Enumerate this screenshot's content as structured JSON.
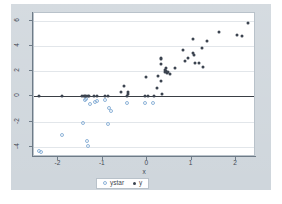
{
  "chart_data": {
    "type": "scatter",
    "title": "",
    "xlabel": "x",
    "ylabel": "",
    "xlim": [
      -2.55,
      2.45
    ],
    "ylim": [
      -4.8,
      6.6
    ],
    "xticks": [
      -2,
      -1,
      0,
      1,
      2
    ],
    "xticklabels": [
      "-2",
      "-1",
      "0",
      "1",
      "2"
    ],
    "yticks": [
      -4,
      -2,
      0,
      2,
      4,
      6
    ],
    "yticklabels": [
      "-4",
      "-2",
      "0",
      "2",
      "4",
      "6"
    ],
    "grid": "horizontal",
    "zero_line": true,
    "legend_position": "below-center",
    "series": [
      {
        "name": "ystar",
        "marker": "open-circle",
        "color": "#8fb4d9",
        "points": [
          [
            -2.44,
            -4.3
          ],
          [
            -2.4,
            -4.38
          ],
          [
            -1.92,
            -3.05
          ],
          [
            -1.44,
            -2.12
          ],
          [
            -1.36,
            -3.55
          ],
          [
            -1.33,
            -3.95
          ],
          [
            -1.3,
            -0.62
          ],
          [
            -1.18,
            -0.42
          ],
          [
            -1.12,
            -0.38
          ],
          [
            -0.96,
            -0.3
          ],
          [
            -0.88,
            -2.22
          ],
          [
            -0.86,
            -0.95
          ],
          [
            -0.82,
            -1.15
          ],
          [
            -0.46,
            -0.55
          ],
          [
            -0.04,
            -0.55
          ],
          [
            0.14,
            -0.52
          ],
          [
            -1.4,
            -0.3
          ],
          [
            -1.37,
            -0.2
          ]
        ]
      },
      {
        "name": "y",
        "marker": "filled-circle",
        "color": "#3c4450",
        "points": [
          [
            -2.44,
            0.0
          ],
          [
            -1.92,
            0.0
          ],
          [
            -1.46,
            0.0
          ],
          [
            -1.42,
            0.0
          ],
          [
            -1.4,
            0.0
          ],
          [
            -1.37,
            0.0
          ],
          [
            -1.34,
            0.0
          ],
          [
            -1.31,
            0.0
          ],
          [
            -1.19,
            0.0
          ],
          [
            -1.12,
            0.0
          ],
          [
            -0.96,
            0.0
          ],
          [
            -0.88,
            0.0
          ],
          [
            -0.6,
            0.38
          ],
          [
            -0.52,
            0.85
          ],
          [
            -0.46,
            0.02
          ],
          [
            -0.44,
            0.18
          ],
          [
            -0.43,
            0.32
          ],
          [
            -0.06,
            0.05
          ],
          [
            0.02,
            0.06
          ],
          [
            -0.02,
            1.5
          ],
          [
            0.16,
            0.05
          ],
          [
            0.22,
            0.68
          ],
          [
            0.25,
            1.6
          ],
          [
            0.3,
            1.18
          ],
          [
            0.34,
            0.18
          ],
          [
            0.3,
            2.92
          ],
          [
            0.31,
            3.02
          ],
          [
            0.32,
            2.55
          ],
          [
            0.4,
            1.95
          ],
          [
            0.41,
            2.12
          ],
          [
            0.42,
            2.25
          ],
          [
            0.43,
            2.02
          ],
          [
            0.44,
            1.82
          ],
          [
            0.46,
            1.92
          ],
          [
            0.52,
            1.78
          ],
          [
            0.62,
            2.22
          ],
          [
            0.8,
            3.68
          ],
          [
            0.84,
            2.8
          ],
          [
            0.92,
            3.05
          ],
          [
            1.02,
            4.58
          ],
          [
            1.04,
            3.4
          ],
          [
            1.06,
            3.28
          ],
          [
            1.08,
            2.68
          ],
          [
            1.16,
            2.62
          ],
          [
            1.24,
            3.85
          ],
          [
            1.26,
            2.3
          ],
          [
            1.34,
            4.4
          ],
          [
            1.62,
            5.12
          ],
          [
            2.02,
            4.82
          ],
          [
            2.14,
            4.8
          ],
          [
            2.26,
            5.8
          ]
        ]
      }
    ]
  },
  "legend": {
    "items": [
      {
        "label": "ystar",
        "marker": "open-circle"
      },
      {
        "label": "y",
        "marker": "filled-circle"
      }
    ]
  },
  "colors": {
    "background": "#cfd6dc",
    "plot_background": "#ffffff",
    "grid": "#e2e6ea",
    "axis": "#6e7b87",
    "zero_line": "#3a3f45",
    "series_ystar": "#8fb4d9",
    "series_y": "#3c4450",
    "text": "#3f4751"
  }
}
